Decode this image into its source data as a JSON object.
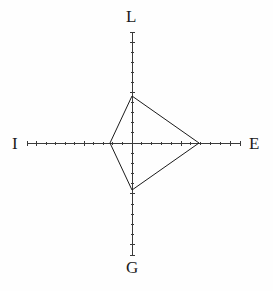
{
  "chart_data": {
    "type": "radar",
    "title": "",
    "subtitle": "",
    "xlabel": "",
    "ylabel": "",
    "grid": false,
    "legend": "none",
    "center": {
      "x": 132,
      "y": 143
    },
    "axis_labels": [
      "L",
      "E",
      "G",
      "I"
    ],
    "axes": [
      {
        "name": "L",
        "label": "L",
        "direction": "up",
        "angle_deg": 90,
        "axis_length_px": 111,
        "tick_count": 11,
        "value": 47
      },
      {
        "name": "E",
        "label": "E",
        "direction": "right",
        "angle_deg": 0,
        "axis_length_px": 108,
        "tick_count": 11,
        "value": 67
      },
      {
        "name": "G",
        "label": "G",
        "direction": "down",
        "angle_deg": 270,
        "axis_length_px": 112,
        "tick_count": 11,
        "value": 47
      },
      {
        "name": "I",
        "label": "I",
        "direction": "left",
        "angle_deg": 180,
        "axis_length_px": 105,
        "tick_count": 11,
        "value": 22
      }
    ],
    "categories": [
      "L",
      "E",
      "G",
      "I"
    ],
    "values": [
      47,
      67,
      47,
      22
    ],
    "series": [
      {
        "name": "profile",
        "values": [
          47,
          67,
          47,
          22
        ]
      }
    ],
    "polygon_points_px": [
      {
        "axis": "L",
        "x": 132,
        "y": 96
      },
      {
        "axis": "E",
        "x": 199,
        "y": 143
      },
      {
        "axis": "G",
        "x": 132,
        "y": 190
      },
      {
        "axis": "I",
        "x": 110,
        "y": 143
      }
    ],
    "axis_endpoints_px": {
      "L": {
        "x": 132,
        "y": 32
      },
      "E": {
        "x": 240,
        "y": 143
      },
      "G": {
        "x": 132,
        "y": 255
      },
      "I": {
        "x": 27,
        "y": 143
      }
    },
    "ylim": [
      0,
      110
    ]
  },
  "style": {
    "background_color": "#fefefe",
    "axis_color": "#3a3a3a",
    "polygon_color": "#1b1b1b",
    "label_color": "#1b1b1b",
    "axis_stroke_width": 1,
    "polygon_stroke_width": 1,
    "tick_length_px": 5,
    "minor_tick_length_px": 3
  },
  "labels": {
    "top": "L",
    "right": "E",
    "bottom": "G",
    "left": "I"
  }
}
